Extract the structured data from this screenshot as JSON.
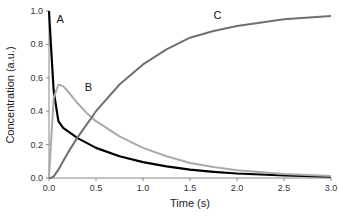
{
  "chart_data": {
    "type": "line",
    "title": "",
    "xlabel": "Time (s)",
    "ylabel": "Concentration (a.u.)",
    "xlim": [
      0,
      3.0
    ],
    "ylim": [
      0,
      1.0
    ],
    "grid": false,
    "legend": "inline labels",
    "x_ticks": [
      "0.0",
      "0.5",
      "1.0",
      "1.5",
      "2.0",
      "2.5",
      "3.0"
    ],
    "y_ticks": [
      "0.0",
      "0.2",
      "0.4",
      "0.6",
      "0.8",
      "1.0"
    ],
    "x": [
      0.0,
      0.02,
      0.05,
      0.1,
      0.15,
      0.2,
      0.3,
      0.4,
      0.5,
      0.75,
      1.0,
      1.25,
      1.5,
      1.75,
      2.0,
      2.5,
      3.0
    ],
    "series": [
      {
        "name": "A",
        "color": "#000000",
        "values": [
          1.0,
          0.8,
          0.52,
          0.34,
          0.3,
          0.28,
          0.24,
          0.21,
          0.18,
          0.13,
          0.095,
          0.07,
          0.05,
          0.037,
          0.027,
          0.015,
          0.008
        ]
      },
      {
        "name": "B",
        "color": "#aaaaaa",
        "values": [
          0.0,
          0.2,
          0.48,
          0.56,
          0.55,
          0.52,
          0.45,
          0.39,
          0.34,
          0.25,
          0.18,
          0.13,
          0.09,
          0.065,
          0.047,
          0.024,
          0.012
        ]
      },
      {
        "name": "C",
        "color": "#707070",
        "values": [
          0.0,
          0.0,
          0.01,
          0.05,
          0.1,
          0.15,
          0.24,
          0.32,
          0.4,
          0.56,
          0.68,
          0.77,
          0.84,
          0.88,
          0.91,
          0.95,
          0.97
        ]
      }
    ],
    "annotations": [
      {
        "text": "A",
        "x": 0.08,
        "y": 0.93
      },
      {
        "text": "B",
        "x": 0.38,
        "y": 0.52
      },
      {
        "text": "C",
        "x": 1.75,
        "y": 0.95
      }
    ]
  }
}
